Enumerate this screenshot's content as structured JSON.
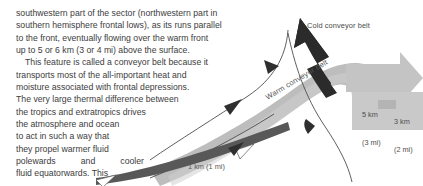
{
  "figure": {
    "colors": {
      "warm_band": "#b8b8b8",
      "warm_band_light": "#c9c9c9",
      "cold_arrow": "#2b2b2b",
      "front_line": "#4a4a4a",
      "surface_arrow": "#555555",
      "text": "#3d3d3d",
      "label": "#4a4a4a"
    },
    "labels": {
      "cold_conveyor": "Cold conveyor belt",
      "warm_conveyor": "Warm conveyor belt",
      "surface_height": "1 km (1 mi)",
      "height_5km": "5 km",
      "height_5km_sub": "(3 mi)",
      "height_3km": "3 km",
      "height_3km_sub": "(2 mi)"
    }
  },
  "body": {
    "paragraph1": [
      "southwestern part of the sector (northwestern part in",
      "southern hemisphere frontal lows), as its runs parallel",
      "to the front, eventually flowing over the warm front",
      "up to 5 or 6 km (3 or 4 mi) above the surface."
    ],
    "paragraph2_line1_a": "This feature is called a conveyor belt because it",
    "paragraph2": [
      "transports most of the all-important heat and",
      "moisture associated with frontal depressions.",
      "The very large thermal difference between",
      "the tropics and extratropics drives",
      "the atmosphere and ocean",
      "to act in such a way that",
      "they propel warmer fluid"
    ],
    "justified_line": [
      "polewards",
      "and",
      "cooler"
    ],
    "last_line": "fluid equatorwards. This"
  }
}
